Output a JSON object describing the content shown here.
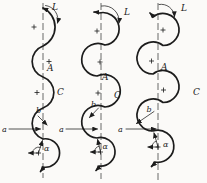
{
  "diagram": {
    "background": "#fbfaf8",
    "ink": "#1c1c1c",
    "description_labels": {
      "length": "L",
      "amplitude": "A",
      "curve_mark": "C",
      "width": "a",
      "radius": "b",
      "angle": "α"
    },
    "panels": [
      {
        "name": "meander-shallow-arcs",
        "labels": {
          "length": "L",
          "amplitude": "A",
          "curve_mark": "C",
          "width": "a",
          "radius": "b",
          "angle": "α"
        },
        "plus_marks": 4
      },
      {
        "name": "meander-semicircular-loops",
        "labels": {
          "length": "L",
          "amplitude": "A",
          "curve_mark": "C",
          "width": "a",
          "radius": "b",
          "angle": "α"
        },
        "plus_marks": 4
      },
      {
        "name": "meander-overlapping-loops",
        "labels": {
          "length": "L",
          "amplitude": "A",
          "curve_mark": "C",
          "width": "a",
          "radius": "b",
          "angle": "α"
        },
        "plus_marks": 4
      }
    ]
  }
}
